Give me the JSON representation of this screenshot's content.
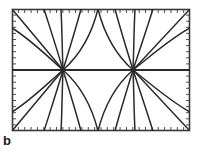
{
  "figure": {
    "panel_label": "b",
    "caption_position": "below-left",
    "background_color": "#ffffff",
    "stroke_color": "#2a2a2a",
    "frame_color": "#3a3a3a",
    "frame": {
      "x": 12,
      "y": 9,
      "width": 178,
      "height": 122,
      "tick_count_horizontal": 28,
      "tick_count_vertical": 20,
      "tick_length": 3,
      "tick_side": "inward"
    },
    "axis_line": {
      "type": "horizontal",
      "y": 70,
      "x_start": 12,
      "x_end": 190,
      "description": "separatrix line joining the two singular points"
    }
  },
  "chart_data": {
    "type": "line",
    "title": "",
    "subtitle": "",
    "xlabel": "",
    "ylabel": "",
    "xlim": [
      0,
      178
    ],
    "ylim": [
      0,
      122
    ],
    "grid": false,
    "legend": null,
    "annotations": [
      {
        "text": "b",
        "x": 3,
        "y": 140
      }
    ],
    "singular_points": [
      {
        "name": "left-node",
        "x": 63,
        "y": 70,
        "type": "radial-node",
        "marker": "dot"
      },
      {
        "name": "right-node",
        "x": 133,
        "y": 70,
        "type": "radial-node",
        "marker": "dot"
      }
    ],
    "series": [
      {
        "name": "left-node-trajectories",
        "node": [
          63,
          70
        ],
        "values": [
          {
            "id": "L1",
            "path": "M 63 70 L 12 9"
          },
          {
            "id": "L2",
            "path": "M 63 70 C 56 46 50 28 44 9"
          },
          {
            "id": "L3",
            "path": "M 63 70 C 62 45 62 27 61 9"
          },
          {
            "id": "L4",
            "path": "M 63 70 C 70 47 76 28 81 9"
          },
          {
            "id": "L5",
            "path": "M 63 70 C 80 55 92 33 98 9"
          },
          {
            "id": "L6",
            "path": "M 63 70 L 12 70"
          },
          {
            "id": "L7",
            "path": "M 63 70 L 12 131"
          },
          {
            "id": "L8",
            "path": "M 63 70 C 56 94 50 112 44 131"
          },
          {
            "id": "L9",
            "path": "M 63 70 C 62 95 62 113 61 131"
          },
          {
            "id": "L10",
            "path": "M 63 70 C 70 93 76 112 81 131"
          },
          {
            "id": "L11",
            "path": "M 63 70 C 80 85 92 107 98 131"
          },
          {
            "id": "L12",
            "path": "M 63 70 C 46 55 30 39 12 28"
          },
          {
            "id": "L13",
            "path": "M 63 70 C 46 85 30 101 12 112"
          }
        ]
      },
      {
        "name": "right-node-trajectories",
        "node": [
          133,
          70
        ],
        "values": [
          {
            "id": "R1",
            "path": "M 133 70 L 190 9"
          },
          {
            "id": "R2",
            "path": "M 133 70 C 141 46 147 28 153 9"
          },
          {
            "id": "R3",
            "path": "M 133 70 C 134 45 134 27 135 9"
          },
          {
            "id": "R4",
            "path": "M 133 70 C 126 47 120 28 115 9"
          },
          {
            "id": "R5",
            "path": "M 133 70 C 116 55 104 33 98 9"
          },
          {
            "id": "R6",
            "path": "M 133 70 L 190 70"
          },
          {
            "id": "R7",
            "path": "M 133 70 L 190 131"
          },
          {
            "id": "R8",
            "path": "M 133 70 C 141 94 147 112 153 131"
          },
          {
            "id": "R9",
            "path": "M 133 70 C 134 95 134 113 135 131"
          },
          {
            "id": "R10",
            "path": "M 133 70 C 126 93 120 112 115 131"
          },
          {
            "id": "R11",
            "path": "M 133 70 C 116 85 104 107 98 131"
          },
          {
            "id": "R12",
            "path": "M 133 70 C 152 55 170 39 190 28"
          },
          {
            "id": "R13",
            "path": "M 133 70 C 152 85 170 101 190 112"
          }
        ]
      }
    ]
  }
}
